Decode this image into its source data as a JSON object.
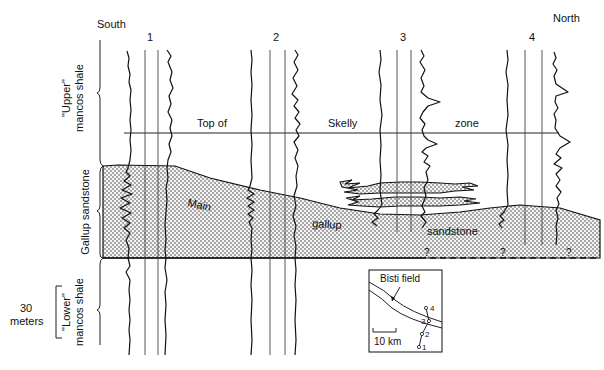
{
  "diagram": {
    "type": "stratigraphic cross-section (well log correlation)",
    "orientation": {
      "left": "South",
      "right": "North"
    },
    "wells": [
      {
        "id": "1",
        "x": 151
      },
      {
        "id": "2",
        "x": 277
      },
      {
        "id": "3",
        "x": 404
      },
      {
        "id": "4",
        "x": 533
      }
    ],
    "datum_line": {
      "words": [
        "Top of",
        "Skelly",
        "zone"
      ]
    },
    "units": [
      {
        "label_line1": "\"Upper\"",
        "label_line2": "mancos shale"
      },
      {
        "label_line1": "Gallup sandstone",
        "label_line2": ""
      },
      {
        "label_line1": "\"Lower\"",
        "label_line2": "mancos shale"
      }
    ],
    "sandstone_labels": [
      "Main",
      "gallup",
      "sandstone"
    ],
    "question_marks": [
      "?",
      "?",
      "?"
    ],
    "scale_bar": {
      "value": "30",
      "unit": "meters"
    },
    "inset_map": {
      "title": "Bisti field",
      "scale_label": "10 km",
      "well_labels": [
        "1",
        "2",
        "3",
        "4"
      ]
    },
    "colors": {
      "ink": "#111111",
      "background": "#ffffff",
      "sandstone_fill": "#e8e8e8"
    }
  }
}
